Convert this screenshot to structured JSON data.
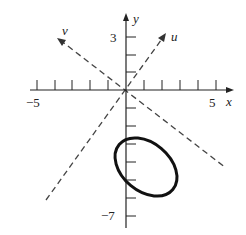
{
  "figure": {
    "axes": {
      "x_label": "x",
      "y_label": "y",
      "x_ticks": [
        -5,
        -4,
        -3,
        -2,
        -1,
        1,
        2,
        3,
        4,
        5
      ],
      "y_ticks": [
        3,
        2,
        1,
        -1,
        -2,
        -3,
        -4,
        -5,
        -6,
        -7
      ],
      "x_tick_labels": {
        "min": "−5",
        "max": "5"
      },
      "y_tick_labels": {
        "max": "3",
        "min": "−7"
      }
    },
    "rotated_axes": {
      "u_label": "u",
      "v_label": "v"
    },
    "ellipse": {
      "center": [
        1,
        -4
      ],
      "description": "tilted ellipse centered below origin"
    },
    "colors": {
      "stroke": "#222222",
      "dash": "#444444"
    }
  }
}
